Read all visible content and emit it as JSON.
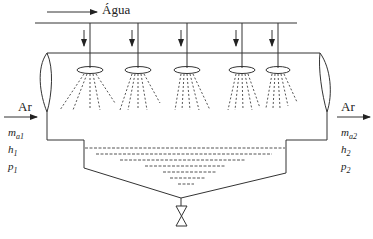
{
  "diagram": {
    "type": "spray humidifier / air washer schematic",
    "water_label": "Água",
    "inlet": {
      "label": "Ar",
      "vars": [
        {
          "sym": "m",
          "sub": "a1"
        },
        {
          "sym": "h",
          "sub": "1"
        },
        {
          "sym": "p",
          "sub": "1"
        }
      ]
    },
    "outlet": {
      "label": "Ar",
      "vars": [
        {
          "sym": "m",
          "sub": "a2"
        },
        {
          "sym": "h",
          "sub": "2"
        },
        {
          "sym": "p",
          "sub": "2"
        }
      ]
    },
    "nozzle_count": 5,
    "colors": {
      "line": "#333333",
      "background": "#ffffff"
    }
  }
}
